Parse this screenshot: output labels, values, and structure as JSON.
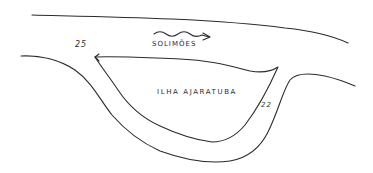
{
  "map": {
    "river_name": "SOLIMÕES",
    "island_name": "ILHA AJARATUBA",
    "markers": [
      {
        "label": "25"
      },
      {
        "label": "22"
      }
    ],
    "colors": {
      "ink": "#2b2b2b",
      "paper": "#ffffff"
    },
    "features": [
      {
        "name": "north-riverbank",
        "type": "line"
      },
      {
        "name": "island-outline",
        "type": "closed-shape"
      },
      {
        "name": "south-riverbank",
        "type": "line"
      },
      {
        "name": "flow-direction-arrow",
        "type": "arrow",
        "direction": "east"
      }
    ]
  }
}
